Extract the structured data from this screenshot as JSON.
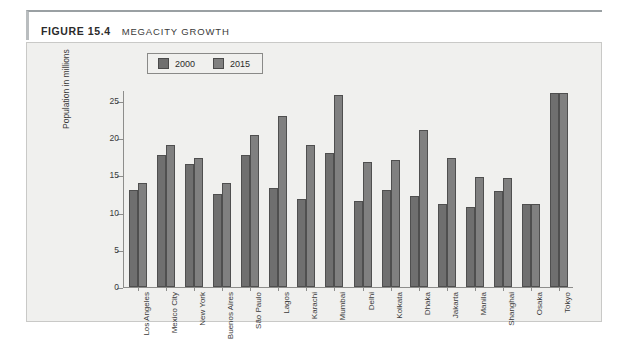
{
  "figure": {
    "number": "FIGURE 15.4",
    "title": "MEGACITY GROWTH"
  },
  "legend": {
    "items": [
      {
        "label": "2000",
        "color": "#6f6f6f"
      },
      {
        "label": "2015",
        "color": "#808080"
      }
    ]
  },
  "axis": {
    "y_label": "Population in millions",
    "y_ticks": [
      "0",
      "5",
      "10",
      "15",
      "20",
      "25"
    ]
  },
  "chart_data": {
    "type": "bar",
    "title": "MEGACITY GROWTH",
    "xlabel": "",
    "ylabel": "Population in millions",
    "ylim": [
      0,
      26.5
    ],
    "grid": false,
    "legend_position": "top-left-inside",
    "categories": [
      "Los Angeles",
      "Mexico City",
      "New York",
      "Buenos Aires",
      "São Paulo",
      "Lagos",
      "Karachi",
      "Mumbai",
      "Delhi",
      "Kolkata",
      "Dhaka",
      "Jakarta",
      "Manila",
      "Shanghai",
      "Osaka",
      "Tokyo"
    ],
    "series": [
      {
        "name": "2000",
        "values": [
          13.0,
          17.8,
          16.5,
          12.5,
          17.7,
          13.3,
          11.8,
          18.0,
          11.6,
          13.0,
          12.2,
          11.1,
          10.8,
          12.9,
          11.1,
          26.1
        ]
      },
      {
        "name": "2015",
        "values": [
          14.0,
          19.1,
          17.3,
          14.0,
          20.4,
          23.0,
          19.1,
          25.8,
          16.8,
          17.1,
          21.1,
          17.3,
          14.8,
          14.6,
          11.1,
          26.1
        ]
      }
    ]
  }
}
